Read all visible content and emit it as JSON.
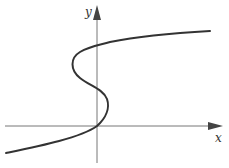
{
  "figure": {
    "axes": {
      "x_label": "x",
      "y_label": "y"
    },
    "colors": {
      "background": "#ffffff",
      "axis": "#666666",
      "curve": "#333333",
      "arrowhead": "#444444"
    }
  }
}
